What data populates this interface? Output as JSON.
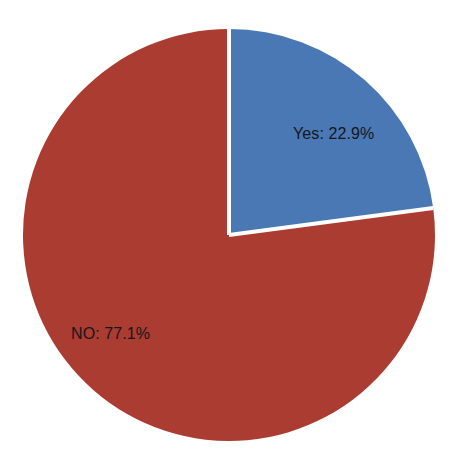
{
  "chart_data": {
    "type": "pie",
    "title": "",
    "subtitle": "",
    "xlabel": "",
    "ylabel": "",
    "grid": false,
    "legend": "none",
    "labels_inside_slices": true,
    "start_angle_deg": 0,
    "direction": "clockwise",
    "categories": [
      "Yes",
      "NO"
    ],
    "values": [
      22.9,
      77.1
    ],
    "units": "percent",
    "slices": [
      {
        "name": "Yes",
        "value": 22.9,
        "label": "Yes: 22.9%",
        "color": "#4a78b4",
        "angle_deg": 82.44,
        "label_x": 293,
        "label_y": 126
      },
      {
        "name": "NO",
        "value": 77.1,
        "label": "NO: 77.1%",
        "color": "#ab3c31",
        "angle_deg": 277.56,
        "label_x": 71,
        "label_y": 326
      }
    ],
    "geometry": {
      "center_x": 229,
      "center_y": 235,
      "radius": 206,
      "separator_color": "#ffffff",
      "separator_width": 4
    },
    "colors": {
      "background": "#ffffff",
      "label_text": "#15161c",
      "yes": "#4a78b4",
      "no": "#ab3c31"
    }
  }
}
